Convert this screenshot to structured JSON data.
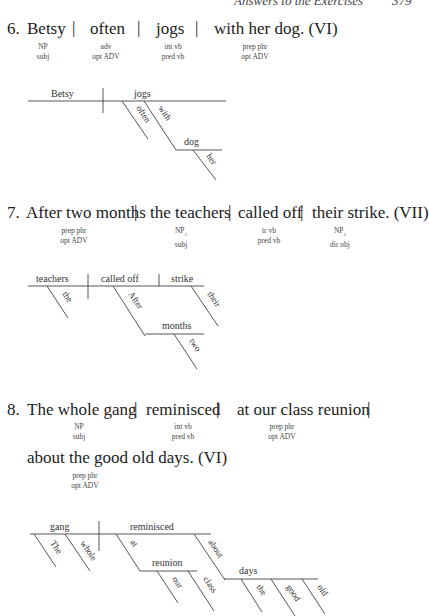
{
  "header": {
    "running_title": "Answers to the Exercises",
    "page_number": "379"
  },
  "exercises": [
    {
      "number": "6.",
      "segments": [
        "Betsy",
        "often",
        "jogs",
        "with her dog. (VI)"
      ],
      "labels": [
        {
          "form": "NP",
          "function": "subj"
        },
        {
          "form": "adv",
          "function": "opt ADV"
        },
        {
          "form": "int vb",
          "function": "pred vb"
        },
        {
          "form": "prep phr",
          "function": "opt ADV"
        }
      ],
      "diagram": {
        "subject": "Betsy",
        "verb": "jogs",
        "modifiers": [
          "often",
          "with",
          "dog",
          "her"
        ]
      }
    },
    {
      "number": "7.",
      "segments": [
        "After two months",
        "the teachers",
        "called off",
        "their strike. (VII)"
      ],
      "labels": [
        {
          "form": "prep phr",
          "function": "opt ADV"
        },
        {
          "form": "NP",
          "sub": "1",
          "function": "subj"
        },
        {
          "form": "tr vb",
          "function": "pred vb"
        },
        {
          "form": "NP",
          "sub": "2",
          "function": "dir obj"
        }
      ],
      "diagram": {
        "subject": "teachers",
        "verb": "called off",
        "object": "strike",
        "modifiers": [
          "the",
          "After",
          "months",
          "two",
          "their"
        ]
      }
    },
    {
      "number": "8.",
      "segments": [
        "The whole gang",
        "reminisced",
        "at our class reunion",
        "about the good old days. (VI)"
      ],
      "labels": [
        {
          "form": "NP",
          "function": "subj"
        },
        {
          "form": "int vb",
          "function": "pred vb"
        },
        {
          "form": "prep phr",
          "function": "opt ADV"
        },
        {
          "form": "prep phr",
          "function": "opt ADV"
        }
      ],
      "diagram": {
        "subject": "gang",
        "verb": "reminisced",
        "modifiers": [
          "The",
          "whole",
          "at",
          "reunion",
          "our",
          "class",
          "about",
          "days",
          "the",
          "good",
          "old"
        ]
      }
    }
  ]
}
